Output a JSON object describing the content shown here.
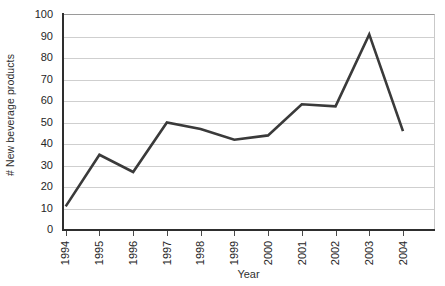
{
  "chart_data": {
    "type": "line",
    "title": "",
    "subtitle": "",
    "xlabel": "Year",
    "ylabel": "# New beverage products",
    "categories": [
      "1994",
      "1995",
      "1996",
      "1997",
      "1998",
      "1999",
      "2000",
      "2001",
      "2002",
      "2003",
      "2004"
    ],
    "values": [
      11,
      35,
      27,
      50,
      47,
      42,
      44,
      58.5,
      57.5,
      91,
      46
    ],
    "series": [
      {
        "name": "# New beverage products",
        "values": [
          11,
          35,
          27,
          50,
          47,
          42,
          44,
          58.5,
          57.5,
          91,
          46
        ]
      }
    ],
    "ylim": [
      0,
      100
    ],
    "ytick_step": 10,
    "yticks": [
      "100",
      "90",
      "80",
      "70",
      "60",
      "50",
      "40",
      "30",
      "20",
      "10",
      "0"
    ],
    "xtick_labels": [
      "1994",
      "1995",
      "1996",
      "1997",
      "1998",
      "1999",
      "2000",
      "2001",
      "2002",
      "2003",
      "2004"
    ],
    "xtick_rotation": 90,
    "grid": "horizontal",
    "legend": "none",
    "annotations": [],
    "colors": {
      "line": "#3a3a3a",
      "grid": "#cfcfcf",
      "axis": "#2e2e2e",
      "text": "#262626",
      "background": "#ffffff"
    },
    "line_width": 2.6,
    "markers": "none"
  }
}
